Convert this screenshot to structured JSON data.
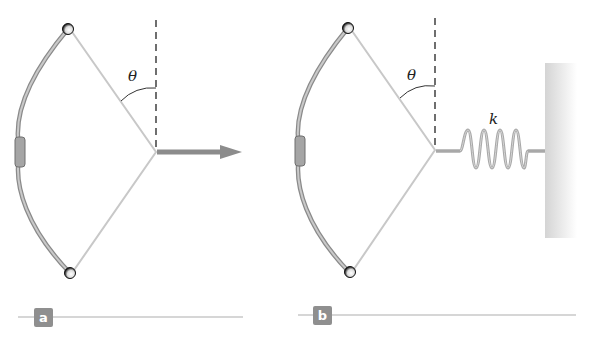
{
  "figure": {
    "panels": [
      {
        "id": "a",
        "label": "a",
        "angle_label": "θ",
        "force": "horizontal pull arrow"
      },
      {
        "id": "b",
        "label": "b",
        "angle_label": "θ",
        "spring_label": "k",
        "support": "wall"
      }
    ]
  },
  "colors": {
    "bow": "#9a9a9a",
    "string": "#c8c8c8",
    "arrow": "#8c8c8c",
    "spring": "#a8a8a8",
    "wall": "#d9d9d9",
    "badge": "#8f8f8f",
    "dashed": "#222222"
  }
}
